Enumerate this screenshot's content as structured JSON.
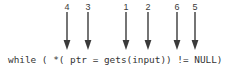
{
  "diagram": {
    "code": "while ( *( ptr = gets(input)) != NULL)",
    "stroke_color": "#3a3a3a",
    "text_color": "#333333",
    "background": "#ffffff",
    "markers": [
      {
        "label": "4",
        "x": 67,
        "target": "*( dereference"
      },
      {
        "label": "3",
        "x": 88,
        "target": "= assignment"
      },
      {
        "label": "1",
        "x": 126,
        "target": "gets call"
      },
      {
        "label": "2",
        "x": 148,
        "target": "input argument"
      },
      {
        "label": "6",
        "x": 177,
        "target": "!= comparison"
      },
      {
        "label": "5",
        "x": 195,
        "target": "NULL"
      }
    ]
  }
}
